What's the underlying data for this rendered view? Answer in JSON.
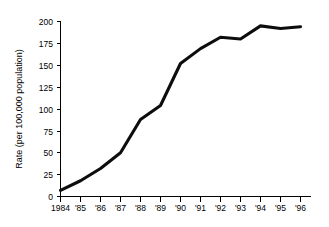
{
  "chart_data": {
    "type": "line",
    "title": "",
    "xlabel": "",
    "ylabel": "Rate (per 100,000 population)",
    "categories": [
      "1984",
      "'85",
      "'86",
      "'87",
      "'88",
      "'89",
      "'90",
      "'91",
      "'92",
      "'93",
      "'94",
      "'95",
      "'96"
    ],
    "x": [
      1984,
      1985,
      1986,
      1987,
      1988,
      1989,
      1990,
      1991,
      1992,
      1993,
      1994,
      1995,
      1996
    ],
    "values": [
      7,
      18,
      32,
      50,
      88,
      104,
      152,
      169,
      182,
      180,
      195,
      192,
      194
    ],
    "ylim": [
      0,
      200
    ],
    "yticks": [
      0,
      25,
      50,
      75,
      100,
      125,
      150,
      175,
      200
    ],
    "ytick_labels": [
      "0",
      "25",
      "50",
      "75",
      "100",
      "125",
      "150",
      "175",
      "200"
    ],
    "xtick_labels": [
      "1984",
      "'85",
      "'86",
      "'87",
      "'88",
      "'89",
      "'90",
      "'91",
      "'92",
      "'93",
      "'94",
      "'95",
      "'96"
    ],
    "grid": false,
    "legend": null,
    "series_color": "#0d0d0d",
    "axis_color": "#000000",
    "background": "#ffffff"
  },
  "axis": {
    "y_title": "Rate (per 100,000 population)"
  }
}
